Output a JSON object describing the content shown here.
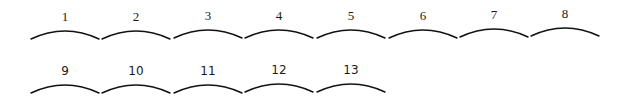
{
  "diagram": {
    "rows": [
      {
        "items": [
          {
            "label": "1",
            "x": 30,
            "y": 10
          },
          {
            "label": "2",
            "x": 101,
            "y": 10
          },
          {
            "label": "3",
            "x": 173,
            "y": 9
          },
          {
            "label": "4",
            "x": 244,
            "y": 9
          },
          {
            "label": "5",
            "x": 316,
            "y": 9
          },
          {
            "label": "6",
            "x": 388,
            "y": 9
          },
          {
            "label": "7",
            "x": 459,
            "y": 8
          },
          {
            "label": "8",
            "x": 530,
            "y": 7
          }
        ]
      },
      {
        "items": [
          {
            "label": "9",
            "x": 30,
            "y": 64
          },
          {
            "label": "10",
            "x": 101,
            "y": 64
          },
          {
            "label": "11",
            "x": 173,
            "y": 64
          },
          {
            "label": "12",
            "x": 244,
            "y": 63
          },
          {
            "label": "13",
            "x": 316,
            "y": 63
          }
        ]
      }
    ],
    "colors": {
      "background": "#ffffff",
      "stroke": "#111111",
      "text": "#1a1a1a"
    }
  }
}
